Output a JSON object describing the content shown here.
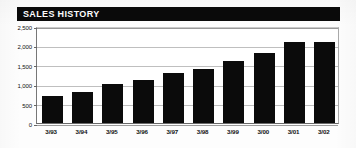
{
  "title": "SALES HISTORY",
  "colors": {
    "banner_background": "#0a0a0a",
    "banner_text": "#ffffff",
    "bar": "#0b0b0b",
    "gridline": "#bfbfbf",
    "axis": "#6a6a6a",
    "plot_background": "#ffffff"
  },
  "chart_data": {
    "type": "bar",
    "title": "SALES HISTORY",
    "xlabel": "",
    "ylabel": "",
    "categories": [
      "3/93",
      "3/94",
      "3/95",
      "3/96",
      "3/97",
      "3/98",
      "3/99",
      "3/00",
      "3/01",
      "3/02"
    ],
    "values": [
      700,
      800,
      1000,
      1100,
      1300,
      1400,
      1600,
      1800,
      2100,
      2090
    ],
    "ylim": [
      0,
      2500
    ],
    "yticks": [
      0,
      500,
      1000,
      1500,
      2000,
      2500
    ],
    "ytick_labels": [
      "0",
      "500",
      "1,000",
      "1,500",
      "2,000",
      "2,500"
    ],
    "grid": true,
    "legend": false,
    "legend_position": "none",
    "series": [
      {
        "name": "Sales",
        "values": [
          700,
          800,
          1000,
          1100,
          1300,
          1400,
          1600,
          1800,
          2100,
          2090
        ]
      }
    ]
  }
}
